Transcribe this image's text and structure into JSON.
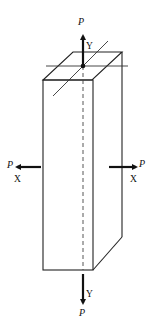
{
  "diagram": {
    "labels": {
      "top_load": "P",
      "top_axis": "Y",
      "bottom_load": "P",
      "bottom_axis": "Y",
      "left_load": "P",
      "left_axis": "X",
      "right_load": "P",
      "right_axis": "X"
    },
    "colors": {
      "line": "#222222",
      "background": "#ffffff"
    }
  }
}
